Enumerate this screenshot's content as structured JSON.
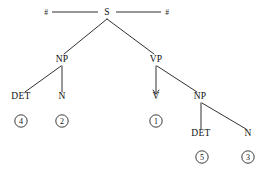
{
  "figure": {
    "type": "syntax-tree",
    "background_color": "#ffffff",
    "line_color": "#1a1a1a",
    "text_color": "#111111"
  },
  "boundaries": {
    "left_symbol": "#",
    "right_symbol": "#"
  },
  "nodes": {
    "s": {
      "label": "S",
      "x": 107,
      "y": 15
    },
    "np_left": {
      "label": "NP",
      "x": 62,
      "y": 62
    },
    "vp": {
      "label": "VP",
      "x": 156,
      "y": 62
    },
    "det_left": {
      "label": "DET",
      "x": 21,
      "y": 99
    },
    "n_left": {
      "label": "N",
      "x": 62,
      "y": 99
    },
    "v": {
      "label": "V",
      "x": 156,
      "y": 99
    },
    "np_right": {
      "label": "NP",
      "x": 200,
      "y": 99
    },
    "det_right": {
      "label": "DET",
      "x": 201,
      "y": 136
    },
    "n_right": {
      "label": "N",
      "x": 248,
      "y": 136
    }
  },
  "indices": [
    {
      "label": "4",
      "x": 21,
      "y": 124,
      "attached_to": "DET"
    },
    {
      "label": "2",
      "x": 62,
      "y": 124,
      "attached_to": "N"
    },
    {
      "label": "1",
      "x": 156,
      "y": 124,
      "attached_to": "V"
    },
    {
      "label": "5",
      "x": 202,
      "y": 160,
      "attached_to": "DET"
    },
    {
      "label": "3",
      "x": 248,
      "y": 160,
      "attached_to": "N"
    }
  ],
  "edges": [
    {
      "from": "s",
      "to": "np_left"
    },
    {
      "from": "s",
      "to": "vp"
    },
    {
      "from": "np_left",
      "to": "det_left"
    },
    {
      "from": "np_left",
      "to": "n_left"
    },
    {
      "from": "vp",
      "to": "v"
    },
    {
      "from": "vp",
      "to": "np_right"
    },
    {
      "from": "np_right",
      "to": "det_right"
    },
    {
      "from": "np_right",
      "to": "n_right"
    }
  ]
}
